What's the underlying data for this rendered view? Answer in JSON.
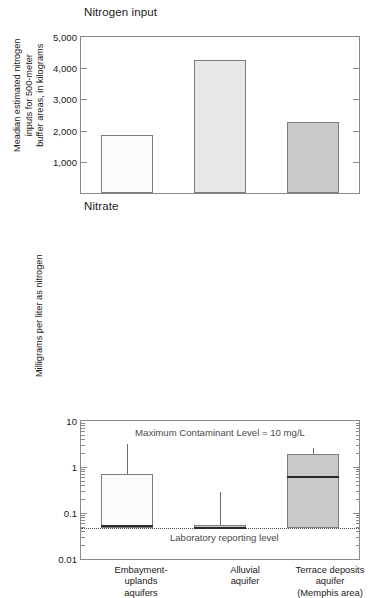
{
  "figure": {
    "panels": [
      {
        "id": "nitrogen-input",
        "title": "Nitrogen input",
        "ylabel": "Meadian estimated nitrogen\ninputs for 500-meter\nbuffer areas, in kilograms"
      },
      {
        "id": "nitrate",
        "title": "Nitrate",
        "ylabel": "Milligrams per liter as nitrogen",
        "annotation_mcl": "Maximum Contaminant Level = 10 mg/L",
        "annotation_lrl": "Laboratory reporting level"
      }
    ],
    "categories": [
      "Embayment-\nuplands\naquifers",
      "Alluvial\naquifer",
      "Terrace deposits\naquifer\n(Memphis area)"
    ]
  },
  "colors": {
    "bar_1": "#fbfbfb",
    "bar_2": "#e8e8e8",
    "bar_3": "#c9c9c9",
    "box_1": "#fbfbfb",
    "box_2": "#c9c9c9",
    "box_3": "#c9c9c9",
    "outline": "#7d7d7d",
    "axis": "#8a8a8a",
    "median": "#2b2b2b",
    "reference_line": "#4a4a4a",
    "text": "#1a1a1a",
    "annotation_text": "#4a4a4a"
  },
  "chart_data": [
    {
      "type": "bar",
      "title": "Nitrogen input",
      "xlabel": "",
      "ylabel": "Meadian estimated nitrogen inputs for 500-meter buffer areas, in kilograms",
      "categories": [
        "Embayment-uplands aquifers",
        "Alluvial aquifer",
        "Terrace deposits aquifer (Memphis area)"
      ],
      "values": [
        1850,
        4260,
        2280
      ],
      "ylim": [
        0,
        5000
      ],
      "yticks": [
        1000,
        2000,
        3000,
        4000,
        5000
      ],
      "ytick_labels": [
        "1,000",
        "2,000",
        "3,000",
        "4,000",
        "5,000"
      ],
      "yscale": "linear",
      "grid": false,
      "legend": "none",
      "bar_fills": [
        "#fbfbfb",
        "#e8e8e8",
        "#c9c9c9"
      ]
    },
    {
      "type": "box",
      "title": "Nitrate",
      "xlabel": "",
      "ylabel": "Milligrams per liter as nitrogen",
      "categories": [
        "Embayment-uplands aquifers",
        "Alluvial aquifer",
        "Terrace deposits aquifer (Memphis area)"
      ],
      "ylim": [
        0.01,
        10
      ],
      "yticks": [
        0.01,
        0.1,
        1,
        10
      ],
      "ytick_labels": [
        "0.01",
        "0.1",
        "1",
        "10"
      ],
      "yscale": "log",
      "grid": false,
      "legend": "none",
      "boxes": [
        {
          "name": "Embayment-uplands aquifers",
          "whisker_high": 3.2,
          "q3": 0.72,
          "median": 0.056,
          "q1": 0.048,
          "whisker_low": 0.048,
          "fill": "#fbfbfb"
        },
        {
          "name": "Alluvial aquifer",
          "whisker_high": 0.29,
          "q3": 0.056,
          "median": 0.05,
          "q1": 0.048,
          "whisker_low": 0.048,
          "fill": "#c9c9c9"
        },
        {
          "name": "Terrace deposits aquifer (Memphis area)",
          "whisker_high": 2.6,
          "q3": 1.9,
          "median": 0.65,
          "q1": 0.048,
          "whisker_low": 0.048,
          "fill": "#c9c9c9"
        }
      ],
      "reference_lines": [
        {
          "label": "Laboratory reporting level",
          "value": 0.048,
          "style": "dotted"
        }
      ],
      "annotations": [
        {
          "text": "Maximum Contaminant Level = 10 mg/L",
          "position": "top-center"
        }
      ]
    }
  ]
}
